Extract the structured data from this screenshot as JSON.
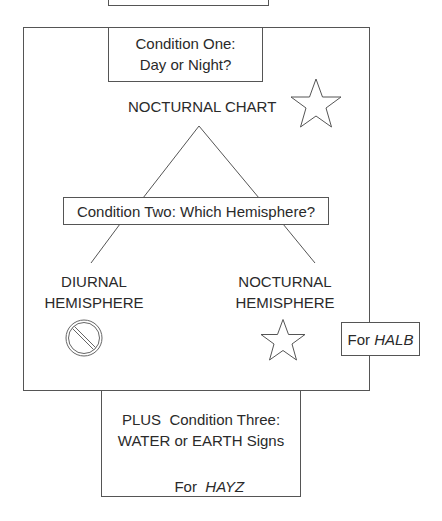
{
  "diagram": {
    "condition_one": {
      "line1": "Condition One:",
      "line2": "Day or Night?"
    },
    "nocturnal_chart": "NOCTURNAL CHART",
    "condition_two": "Condition Two: Which Hemisphere?",
    "diurnal": {
      "line1": "DIURNAL",
      "line2": "HEMISPHERE"
    },
    "nocturnal": {
      "line1": "NOCTURNAL",
      "line2": "HEMISPHERE"
    },
    "for_halb": {
      "prefix": "For ",
      "name": "HALB"
    },
    "condition_three": {
      "line1": "PLUS  Condition Three:",
      "line2": "WATER or EARTH Signs",
      "for_prefix": "For  ",
      "for_name": "HAYZ"
    },
    "icons": {
      "top_star": "star-icon",
      "diurnal_symbol": "prohibited-icon",
      "nocturnal_star": "star-icon"
    },
    "colors": {
      "stroke": "#555555",
      "text": "#2a2a2a",
      "background": "#ffffff"
    }
  }
}
